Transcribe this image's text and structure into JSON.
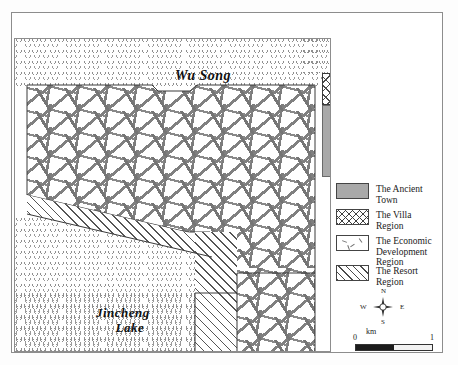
{
  "figure": {
    "type": "thematic-land-use-map"
  },
  "map": {
    "labels": {
      "river": "Wu Song",
      "lake_line1": "Jincheng",
      "lake_line2": "Lake"
    }
  },
  "legend": {
    "items": [
      {
        "label": "The Ancient Town",
        "pattern": "solid-gray",
        "color": "#a9a9a9"
      },
      {
        "label": "The Villa Region",
        "pattern": "cross-hatch",
        "color": "#3f3f3f"
      },
      {
        "label": "The Economic\nDevelopment Region",
        "label_line1": "The Economic",
        "label_line2": "Development Region",
        "pattern": "scattered-dash",
        "color": "#6f6f6f"
      },
      {
        "label": "The Resort Region",
        "pattern": "diagonal-hatch",
        "color": "#4a4a4a"
      }
    ]
  },
  "compass": {
    "north": "N",
    "south": "S",
    "east": "E",
    "west": "W"
  },
  "scale_bar": {
    "unit": "km",
    "min": "0",
    "max": "1"
  }
}
